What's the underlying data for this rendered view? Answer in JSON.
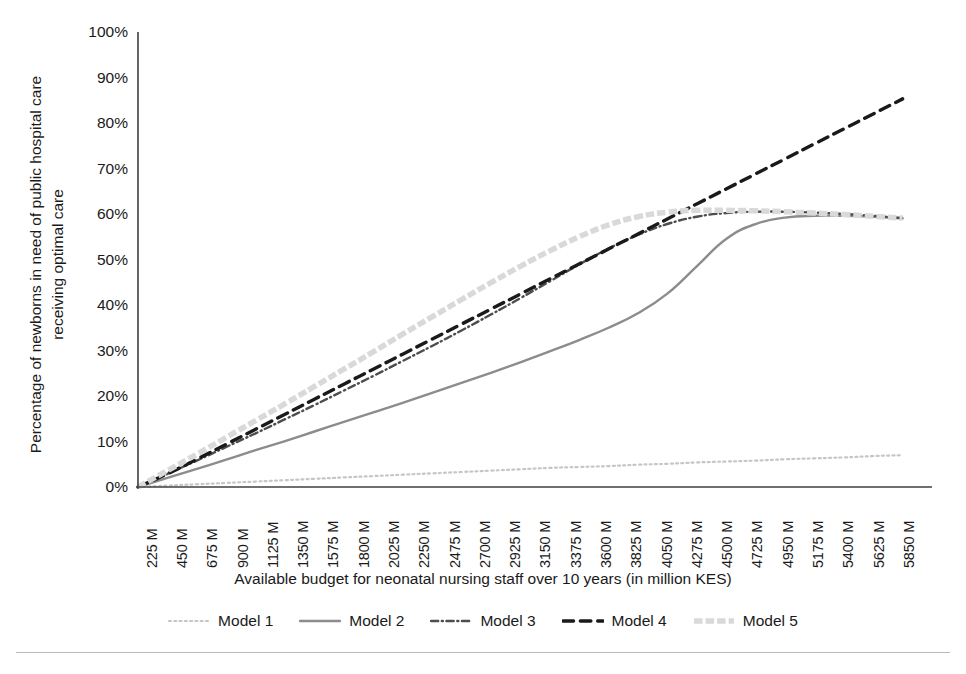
{
  "chart_data": {
    "type": "line",
    "title": "",
    "xlabel": "Available budget for neonatal nursing staff over 10 years (in million KES)",
    "ylabel": "Percentage of newborns in need of public hospital care\nreceiving optimal care",
    "xlim": [
      0,
      6075
    ],
    "ylim": [
      0,
      100
    ],
    "grid": false,
    "legend_position": "bottom",
    "y_ticks": [
      "0%",
      "10%",
      "20%",
      "30%",
      "40%",
      "50%",
      "60%",
      "70%",
      "80%",
      "90%",
      "100%"
    ],
    "y_tick_values": [
      0,
      10,
      20,
      30,
      40,
      50,
      60,
      70,
      80,
      90,
      100
    ],
    "categories": [
      "225 M",
      "450 M",
      "675 M",
      "900 M",
      "1125 M",
      "1350 M",
      "1575 M",
      "1800 M",
      "2025 M",
      "2250 M",
      "2475 M",
      "2700 M",
      "2925 M",
      "3150 M",
      "3375 M",
      "3600 M",
      "3825 M",
      "4050 M",
      "4275 M",
      "4500 M",
      "4725 M",
      "4950 M",
      "5175 M",
      "5400 M",
      "5625 M",
      "5850 M"
    ],
    "x": [
      225,
      450,
      675,
      900,
      1125,
      1350,
      1575,
      1800,
      2025,
      2250,
      2475,
      2700,
      2925,
      3150,
      3375,
      3600,
      3825,
      4050,
      4275,
      4500,
      4725,
      4950,
      5175,
      5400,
      5625,
      5850
    ],
    "series": [
      {
        "name": "Model 1",
        "color": "#c6c6c6",
        "style": "dotted",
        "width": 2.2,
        "values": [
          0.3,
          0.6,
          0.9,
          1.2,
          1.5,
          1.8,
          2.1,
          2.4,
          2.7,
          3.0,
          3.3,
          3.6,
          3.9,
          4.2,
          4.4,
          4.6,
          4.9,
          5.1,
          5.4,
          5.6,
          5.8,
          6.1,
          6.3,
          6.5,
          6.8,
          7.0
        ]
      },
      {
        "name": "Model 2",
        "color": "#8c8c8c",
        "style": "solid",
        "width": 2.4,
        "values": [
          2.0,
          4.0,
          6.0,
          8.1,
          10.1,
          12.2,
          14.3,
          16.4,
          18.5,
          20.7,
          22.9,
          25.1,
          27.4,
          29.8,
          32.3,
          35.0,
          38.2,
          42.5,
          48.5,
          54.5,
          57.8,
          59.2,
          59.6,
          59.6,
          59.4,
          59.0
        ]
      },
      {
        "name": "Model 3",
        "color": "#4d4d4d",
        "style": "dashdot",
        "width": 2.4,
        "values": [
          2.9,
          5.8,
          8.8,
          11.8,
          14.9,
          18.0,
          21.2,
          24.4,
          27.7,
          31.0,
          34.4,
          37.9,
          41.5,
          45.2,
          48.9,
          52.4,
          55.4,
          57.8,
          59.4,
          60.2,
          60.5,
          60.5,
          60.3,
          60.0,
          59.6,
          59.1
        ]
      },
      {
        "name": "Model 4",
        "color": "#1a1a1a",
        "style": "dashed",
        "width": 3.4,
        "values": [
          2.9,
          6.1,
          9.4,
          12.7,
          16.0,
          19.3,
          22.6,
          25.9,
          29.2,
          32.5,
          35.8,
          39.1,
          42.4,
          45.7,
          49.0,
          52.3,
          55.6,
          58.9,
          62.2,
          65.5,
          68.8,
          72.1,
          75.4,
          78.7,
          82.0,
          85.3
        ]
      },
      {
        "name": "Model 5",
        "color": "#d9d9d9",
        "style": "thick-dash",
        "width": 5.5,
        "values": [
          3.6,
          7.2,
          10.9,
          14.6,
          18.3,
          22.1,
          25.9,
          29.7,
          33.6,
          37.4,
          41.2,
          44.9,
          48.5,
          51.9,
          55.0,
          57.6,
          59.4,
          60.4,
          60.8,
          60.8,
          60.7,
          60.5,
          60.2,
          59.9,
          59.5,
          59.1
        ]
      }
    ]
  },
  "legend": {
    "items": [
      {
        "label": "Model 1"
      },
      {
        "label": "Model 2"
      },
      {
        "label": "Model 3"
      },
      {
        "label": "Model 4"
      },
      {
        "label": "Model 5"
      }
    ]
  }
}
